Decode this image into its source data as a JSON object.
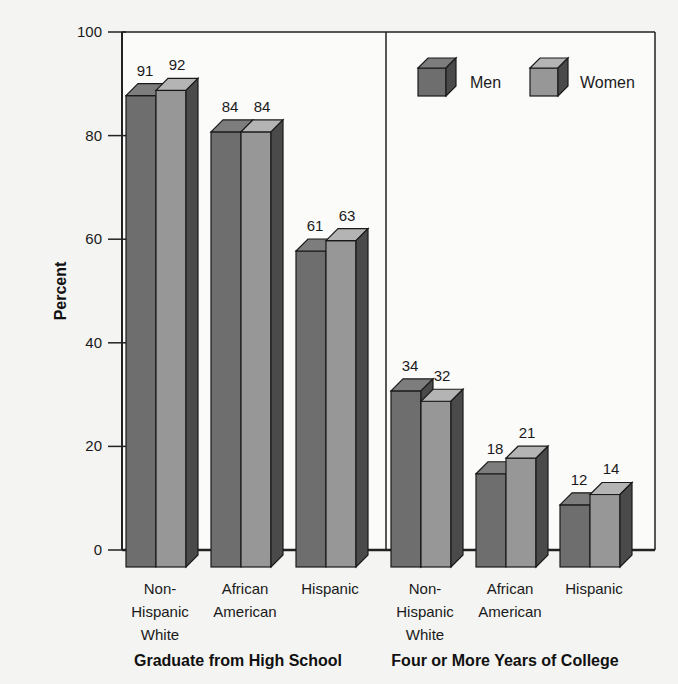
{
  "chart_data": {
    "type": "bar",
    "title": "",
    "xlabel": "",
    "ylabel": "Percent",
    "ylim": [
      0,
      100
    ],
    "yticks": [
      0,
      20,
      40,
      60,
      80,
      100
    ],
    "grid": true,
    "legend_position": "top-right",
    "groups": [
      {
        "label": "Graduate from High School",
        "categories": [
          "Non-Hispanic White",
          "African American",
          "Hispanic"
        ],
        "series": [
          {
            "name": "Men",
            "values": [
              91,
              84,
              61
            ]
          },
          {
            "name": "Women",
            "values": [
              92,
              84,
              63
            ]
          }
        ]
      },
      {
        "label": "Four or More Years of College",
        "categories": [
          "Non-Hispanic White",
          "African American",
          "Hispanic"
        ],
        "series": [
          {
            "name": "Men",
            "values": [
              34,
              18,
              12
            ]
          },
          {
            "name": "Women",
            "values": [
              32,
              21,
              14
            ]
          }
        ]
      }
    ],
    "series_colors": {
      "Men": "#6e6e6e",
      "Women": "#979797"
    }
  },
  "category_lines": {
    "Non-Hispanic White": [
      "Non-",
      "Hispanic",
      "White"
    ],
    "African American": [
      "African",
      "American"
    ],
    "Hispanic": [
      "Hispanic"
    ]
  },
  "legend": {
    "items": [
      {
        "label": "Men",
        "icon": "cube-dark-icon"
      },
      {
        "label": "Women",
        "icon": "cube-light-icon"
      }
    ]
  }
}
